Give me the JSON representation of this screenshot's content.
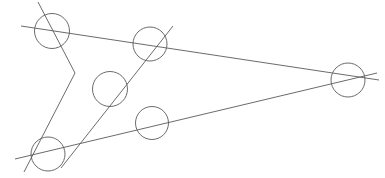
{
  "figure": {
    "canvas": {
      "width": 385,
      "height": 178,
      "background": "#ffffff"
    },
    "style": {
      "stroke_color": "#5a5a5a",
      "stroke_width": 0.9,
      "fill": "none"
    },
    "counts": {
      "circles": 6,
      "lines": 4
    },
    "circles": [
      {
        "name": "circle-top-left",
        "label": "A",
        "cx": 52,
        "cy": 31,
        "r": 17.5
      },
      {
        "name": "circle-top-middle",
        "label": "B",
        "cx": 150,
        "cy": 44,
        "r": 17.0
      },
      {
        "name": "circle-center",
        "label": "C",
        "cx": 110,
        "cy": 89,
        "r": 17.5
      },
      {
        "name": "circle-lower-middle",
        "label": "D",
        "cx": 152,
        "cy": 123,
        "r": 16.5
      },
      {
        "name": "circle-bottom-left",
        "label": "E",
        "cx": 48,
        "cy": 154,
        "r": 17.0
      },
      {
        "name": "circle-right",
        "label": "F",
        "cx": 348,
        "cy": 80,
        "r": 17.0
      }
    ],
    "lines": [
      {
        "name": "line-upper-long",
        "label": "L1",
        "description": "near-horizontal line descending left-to-right through top-left, top-middle and right circles",
        "x1": 21,
        "y1": 26,
        "x2": 379,
        "y2": 80
      },
      {
        "name": "line-steep-descending",
        "label": "L2",
        "description": "steep line descending from top through top-left, center and bottom-left circles",
        "x1": 38,
        "y1": 2,
        "x2": 24,
        "y2": 172
      },
      {
        "name": "line-lower-long",
        "label": "L3",
        "description": "line ascending left-to-right through bottom-left, lower-middle and right circles",
        "x1": 15,
        "y1": 159,
        "x2": 377,
        "y2": 73
      },
      {
        "name": "line-diagonal-rising",
        "label": "L4",
        "description": "diagonal rising from lower-left through center and top-middle circles",
        "x1": 61,
        "y1": 168,
        "x2": 173,
        "y2": 26
      }
    ],
    "steep_note": "L2 bends slightly: it runs from the top edge down through the center circle then continues to the bottom-left circle",
    "steep_segments": [
      {
        "name": "line-steep-upper-segment",
        "x1": 38,
        "y1": 2,
        "x2": 75,
        "y2": 73
      },
      {
        "name": "line-steep-lower-segment",
        "x1": 75,
        "y1": 73,
        "x2": 24,
        "y2": 172
      }
    ]
  }
}
